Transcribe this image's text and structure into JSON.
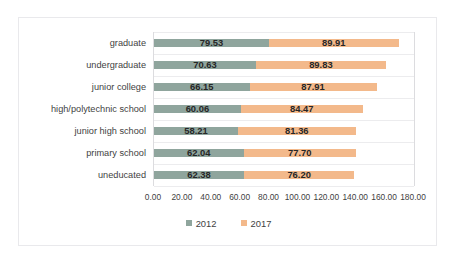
{
  "chart_data": {
    "type": "bar",
    "subtype": "horizontal-stacked",
    "title": "",
    "subtitle": "",
    "xlabel": "",
    "ylabel": "",
    "xlim": [
      0,
      180
    ],
    "xtick_step": 20,
    "grid": true,
    "grid_orientation": "horizontal",
    "legend_position": "bottom",
    "categories": [
      "graduate",
      "undergraduate",
      "junior college",
      "high/polytechnic school",
      "junior high school",
      "primary school",
      "uneducated"
    ],
    "tick_labels": [
      "0.00",
      "20.00",
      "40.00",
      "60.00",
      "80.00",
      "100.00",
      "120.00",
      "140.00",
      "160.00",
      "180.00"
    ],
    "tick_values": [
      0,
      20,
      40,
      60,
      80,
      100,
      120,
      140,
      160,
      180
    ],
    "series": [
      {
        "name": "2012",
        "color": "#8fa59d",
        "values": [
          79.53,
          70.63,
          66.15,
          60.06,
          58.21,
          62.04,
          62.38
        ],
        "labels": [
          "79.53",
          "70.63",
          "66.15",
          "60.06",
          "58.21",
          "62.04",
          "62.38"
        ]
      },
      {
        "name": "2017",
        "color": "#f3b98b",
        "values": [
          89.91,
          89.83,
          87.91,
          84.47,
          81.36,
          77.7,
          76.2
        ],
        "labels": [
          "89.91",
          "89.83",
          "87.91",
          "84.47",
          "81.36",
          "77.70",
          "76.20"
        ]
      }
    ],
    "totals": [
      169.44,
      160.46,
      154.06,
      144.53,
      139.57,
      139.74,
      138.58
    ]
  },
  "legend": {
    "items": [
      {
        "label": "2012",
        "color": "#8fa59d",
        "swatch": "square-swatch"
      },
      {
        "label": "2017",
        "color": "#f3b98b",
        "swatch": "square-swatch"
      }
    ]
  }
}
